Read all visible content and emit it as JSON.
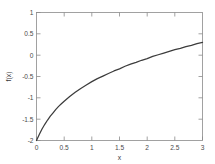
{
  "chart_data": {
    "type": "line",
    "title": "",
    "subtitle": "",
    "xlabel": "x",
    "ylabel": "f(x)",
    "xlim": [
      0,
      3
    ],
    "ylim": [
      -2,
      1
    ],
    "grid": false,
    "legend": null,
    "legend_position": "none",
    "xticks": [
      0,
      0.5,
      1,
      1.5,
      2,
      2.5,
      3
    ],
    "xticklabels": [
      "0",
      "0.5",
      "1",
      "1.5",
      "2",
      "2.5",
      "3"
    ],
    "yticks": [
      -2,
      -1.5,
      -1,
      -0.5,
      0,
      0.5,
      1
    ],
    "yticklabels": [
      "-2",
      "-1.5",
      "-1",
      "-0.5",
      "0",
      "0.5",
      "1"
    ],
    "series": [
      {
        "name": "f(x)",
        "color": "#3c3c3c",
        "linewidth": 1.25,
        "x": [
          0.0,
          0.05,
          0.1,
          0.15,
          0.2,
          0.25,
          0.3,
          0.35,
          0.4,
          0.45,
          0.5,
          0.6,
          0.7,
          0.8,
          0.9,
          1.0,
          1.1,
          1.2,
          1.3,
          1.4,
          1.5,
          1.6,
          1.7,
          1.8,
          1.9,
          2.0,
          2.1,
          2.2,
          2.3,
          2.4,
          2.5,
          2.6,
          2.7,
          2.8,
          2.9,
          3.0
        ],
        "y": [
          -2.0,
          -1.86,
          -1.73,
          -1.62,
          -1.52,
          -1.43,
          -1.35,
          -1.27,
          -1.2,
          -1.14,
          -1.08,
          -0.97,
          -0.87,
          -0.78,
          -0.7,
          -0.62,
          -0.55,
          -0.49,
          -0.43,
          -0.37,
          -0.32,
          -0.26,
          -0.21,
          -0.17,
          -0.12,
          -0.08,
          -0.03,
          0.01,
          0.05,
          0.09,
          0.13,
          0.16,
          0.2,
          0.23,
          0.27,
          0.3
        ]
      }
    ]
  },
  "figure": {
    "background_color": "#ffffff",
    "axes_color": "#8a8a8a",
    "tick_label_color": "#4a4a4a",
    "line_color": "#3c3c3c"
  }
}
